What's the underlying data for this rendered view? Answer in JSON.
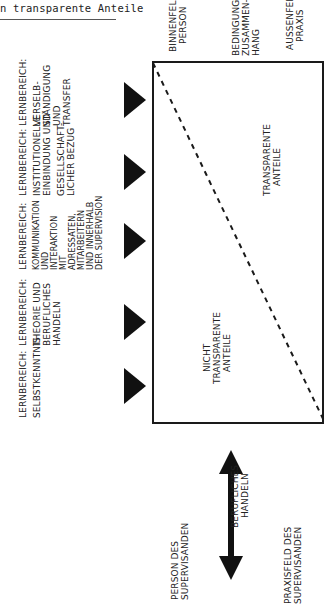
{
  "header": {
    "caption_fragment": "n transparente Anteile"
  },
  "right_labels": {
    "binnenfeld": [
      "Binnenfeld",
      "Person"
    ],
    "bedingungszusammenhang": [
      "Bedingungs-",
      "zusammen-",
      "hang"
    ],
    "aussenfeld": [
      "Aussenfeld",
      "Praxis"
    ]
  },
  "learning_areas": [
    {
      "title": "Lernbereich:",
      "lines": [
        "Selbstkenntnis"
      ]
    },
    {
      "title": "Lernbereich:",
      "lines": [
        "Theorie und",
        "berufliches",
        "Handeln"
      ]
    },
    {
      "title": "Lernbereich:",
      "lines": [
        "Kommunikation",
        "und",
        "Interaktion",
        "mit",
        "Adressaten,",
        "Mitarbeitern",
        "und innerhalb",
        "der Supervision"
      ]
    },
    {
      "title": "Lernbereich:",
      "lines": [
        "Institutionelle",
        "Einbindung und",
        "",
        "gesellschaft-",
        "licher Bezug"
      ]
    },
    {
      "title": "Lernbereich:",
      "lines": [
        "Verselb-",
        "ständigung",
        "und",
        "Transfer"
      ]
    }
  ],
  "box_labels": {
    "transparent": [
      "Transparente",
      "Anteile"
    ],
    "non_transparent": [
      "Nicht",
      "transparente",
      "Anteile"
    ]
  },
  "bottom_axis": {
    "left_label": [
      "Person des",
      "Supervisanden"
    ],
    "center_label": [
      "Berufliches",
      "Handeln"
    ],
    "right_label": [
      "Praxisfeld des",
      "Supervisanden"
    ],
    "arrow_icon": "double-headed-arrow"
  },
  "colors": {
    "ink": "#1a1a1a",
    "paper": "#ffffff"
  }
}
